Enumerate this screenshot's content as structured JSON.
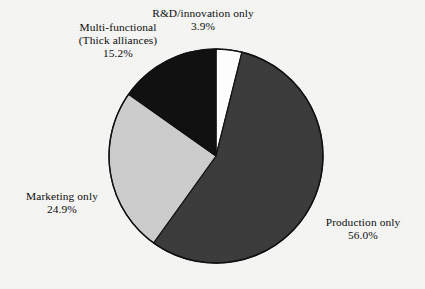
{
  "chart_data": {
    "type": "pie",
    "title": "",
    "subtitle": "",
    "xlabel": "",
    "ylabel": "",
    "legend_position": "none",
    "grid": false,
    "labels_outside": true,
    "start_angle_deg": 0,
    "direction": "clockwise",
    "categories": [
      "R&D/innovation only",
      "Production only",
      "Marketing only",
      "Multi-functional (Thick alliances)"
    ],
    "values": [
      3.9,
      56.0,
      24.9,
      15.2
    ],
    "value_labels": [
      "3.9%",
      "56.0%",
      "24.9%",
      "15.2%"
    ],
    "unit": "%",
    "total": 100.0,
    "slices": [
      {
        "name": "rd-innovation-only",
        "label_lines": [
          "R&D/innovation only"
        ],
        "value": 3.9,
        "value_label": "3.9%",
        "color": "#ffffff",
        "stroke": "#111111",
        "start_deg": 0.0,
        "end_deg": 14.04
      },
      {
        "name": "production-only",
        "label_lines": [
          "Production only"
        ],
        "value": 56.0,
        "value_label": "56.0%",
        "color": "#3c3c3c",
        "stroke": "#111111",
        "start_deg": 14.04,
        "end_deg": 215.64
      },
      {
        "name": "marketing-only",
        "label_lines": [
          "Marketing only"
        ],
        "value": 24.9,
        "value_label": "24.9%",
        "color": "#cdcdcd",
        "stroke": "#111111",
        "start_deg": 215.64,
        "end_deg": 305.28
      },
      {
        "name": "multi-functional",
        "label_lines": [
          "Multi-functional",
          "(Thick alliances)"
        ],
        "value": 15.2,
        "value_label": "15.2%",
        "color": "#111111",
        "stroke": "#111111",
        "start_deg": 305.28,
        "end_deg": 360.0
      }
    ],
    "geometry": {
      "center_x": 216,
      "center_y": 156,
      "radius": 107
    },
    "colors": {
      "background": "#f5f5f4",
      "white_slice": "#ffffff",
      "dark_gray_slice": "#3c3c3c",
      "light_gray_slice": "#cdcdcd",
      "black_slice": "#111111",
      "outline": "#111111",
      "text": "#0d0d0d"
    }
  },
  "labels": {
    "rd": {
      "line1": "R&D/innovation only",
      "pct": "3.9%"
    },
    "multi": {
      "line1": "Multi-functional",
      "line2": "(Thick alliances)",
      "pct": "15.2%"
    },
    "marketing": {
      "line1": "Marketing only",
      "pct": "24.9%"
    },
    "production": {
      "line1": "Production only",
      "pct": "56.0%"
    }
  }
}
